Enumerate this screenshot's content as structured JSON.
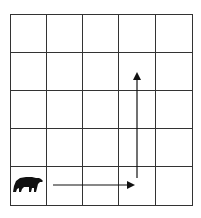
{
  "diagram": {
    "title": "",
    "grid": {
      "rows": 5,
      "cols": 5,
      "left": 10,
      "top": 14,
      "right": 192,
      "bottom": 205,
      "line_color": "#333333"
    },
    "actor": {
      "icon": "bear-icon",
      "cell": {
        "row": 5,
        "col": 1
      },
      "color": "#111111"
    },
    "path": [
      {
        "direction": "right",
        "from": {
          "x": 53,
          "y": 185
        },
        "to": {
          "x": 135,
          "y": 185
        }
      },
      {
        "direction": "up",
        "from": {
          "x": 137,
          "y": 178
        },
        "to": {
          "x": 137,
          "y": 72
        }
      }
    ],
    "arrow_color": "#111111"
  }
}
